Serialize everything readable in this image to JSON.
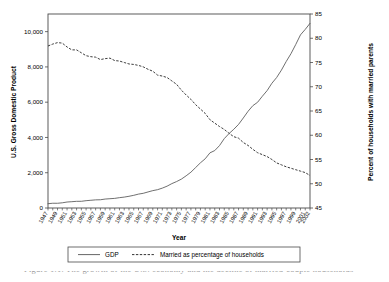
{
  "figure": {
    "background_color": "#ffffff",
    "line_color_gdp": "#555555",
    "line_color_married": "#333333",
    "axis_color": "#4a4a4a"
  },
  "axes": {
    "x_title": "Year",
    "y_left_title": "U.S. Gross Domestic Product",
    "y_right_title": "Percent of households with married parents",
    "y_left_ticks": [
      "0",
      "2,000",
      "4,000",
      "6,000",
      "8,000",
      "10,000"
    ],
    "y_right_ticks": [
      "45",
      "50",
      "55",
      "60",
      "65",
      "70",
      "75",
      "80",
      "85"
    ],
    "x_ticks": [
      "1947",
      "1949",
      "1951",
      "1953",
      "1955",
      "1957",
      "1959",
      "1961",
      "1963",
      "1965",
      "1967",
      "1969",
      "1971",
      "1973",
      "1975",
      "1977",
      "1979",
      "1981",
      "1983",
      "1985",
      "1987",
      "1989",
      "1991",
      "1993",
      "1995",
      "1997",
      "1999",
      "2001",
      "2002"
    ]
  },
  "legend": {
    "items": [
      {
        "label": "GDP",
        "style": "solid"
      },
      {
        "label": "Married as percentage of households",
        "style": "dashed"
      }
    ]
  },
  "caption": {
    "text": "Figure 1.1. The growth of the U.S. economy and the decline of married-couple households"
  },
  "chart_data": {
    "type": "line",
    "title": "",
    "xlabel": "Year",
    "ylabel": "U.S. Gross Domestic Product",
    "y2label": "Percent of households with married parents",
    "xlim": [
      1947,
      2002
    ],
    "ylim": [
      0,
      11000
    ],
    "y2lim": [
      45,
      85
    ],
    "grid": false,
    "legend_position": "below-axis",
    "x": [
      1947,
      1948,
      1949,
      1950,
      1951,
      1952,
      1953,
      1954,
      1955,
      1956,
      1957,
      1958,
      1959,
      1960,
      1961,
      1962,
      1963,
      1964,
      1965,
      1966,
      1967,
      1968,
      1969,
      1970,
      1971,
      1972,
      1973,
      1974,
      1975,
      1976,
      1977,
      1978,
      1979,
      1980,
      1981,
      1982,
      1983,
      1984,
      1985,
      1986,
      1987,
      1988,
      1989,
      1990,
      1991,
      1992,
      1993,
      1994,
      1995,
      1996,
      1997,
      1998,
      1999,
      2000,
      2001,
      2002
    ],
    "series": [
      {
        "name": "GDP",
        "axis": "left",
        "style": "solid",
        "units": "billions of dollars",
        "values": [
          244,
          270,
          268,
          294,
          339,
          358,
          379,
          380,
          415,
          438,
          461,
          467,
          507,
          527,
          545,
          586,
          618,
          664,
          719,
          788,
          833,
          910,
          985,
          1039,
          1127,
          1238,
          1383,
          1500,
          1638,
          1825,
          2031,
          2295,
          2563,
          2790,
          3128,
          3255,
          3537,
          3933,
          4220,
          4463,
          4740,
          5104,
          5484,
          5803,
          5996,
          6338,
          6657,
          7072,
          7398,
          7817,
          8304,
          8747,
          9268,
          9817,
          10128,
          10470
        ]
      },
      {
        "name": "Married as percentage of households",
        "axis": "right",
        "style": "dashed",
        "units": "percent",
        "values": [
          78.4,
          78.8,
          79.1,
          79.0,
          78.2,
          77.6,
          77.6,
          77.0,
          76.4,
          76.2,
          76.1,
          75.6,
          75.8,
          75.9,
          75.4,
          75.3,
          75.0,
          74.7,
          74.6,
          74.4,
          74.1,
          73.6,
          73.2,
          72.4,
          72.2,
          71.9,
          71.2,
          70.5,
          69.3,
          68.3,
          67.4,
          66.3,
          65.4,
          64.5,
          63.2,
          62.5,
          61.8,
          61.2,
          60.4,
          59.7,
          59.4,
          58.5,
          57.9,
          57.1,
          56.4,
          56.0,
          55.6,
          55.0,
          54.3,
          53.9,
          53.5,
          53.2,
          52.9,
          52.6,
          52.3,
          51.7
        ]
      }
    ]
  }
}
